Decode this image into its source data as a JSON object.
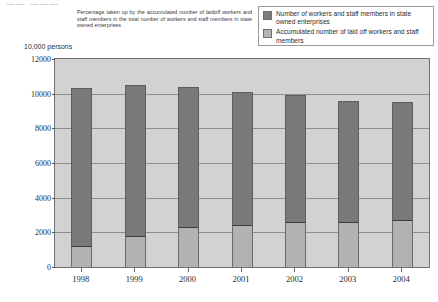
{
  "top_remnant": "——  ———",
  "note": "Percentage taken up by the accumulated number of laidoff workers and staff members in the total number of workers and staff members in state owned enterprises",
  "unit_label": "10,000 persons",
  "legend": {
    "items": [
      {
        "swatch": "dark-gray-swatch",
        "label": "Number of workers and staff members in state owned enterprises",
        "color": "#7a7a7a"
      },
      {
        "swatch": "light-gray-swatch",
        "label": "Accumulated number of laid off workers and staff members",
        "color": "#b4b4b4"
      }
    ]
  },
  "chart_data": {
    "type": "bar",
    "stacked": true,
    "title": "",
    "subtitle": "",
    "xlabel": "",
    "ylabel": "10,000 persons",
    "ylim": [
      0,
      12000
    ],
    "ytick_values": [
      0,
      2000,
      4000,
      6000,
      8000,
      10000,
      12000
    ],
    "ytick_labels": [
      "0",
      "2000",
      "4000",
      "6000",
      "8000",
      "10000",
      "12000"
    ],
    "grid": true,
    "legend_position": "top-right",
    "categories": [
      "1998",
      "1999",
      "2000",
      "2001",
      "2002",
      "2003",
      "2004"
    ],
    "series": [
      {
        "name": "Accumulated number of laid off workers and staff members",
        "color": "#b2b2b2",
        "values": [
          1200,
          1800,
          2300,
          2400,
          2600,
          2600,
          2700
        ]
      },
      {
        "name": "Number of workers and staff members in state owned enterprises",
        "color": "#797979",
        "values": [
          10300,
          10500,
          10400,
          10100,
          9900,
          9600,
          9500
        ]
      }
    ]
  }
}
